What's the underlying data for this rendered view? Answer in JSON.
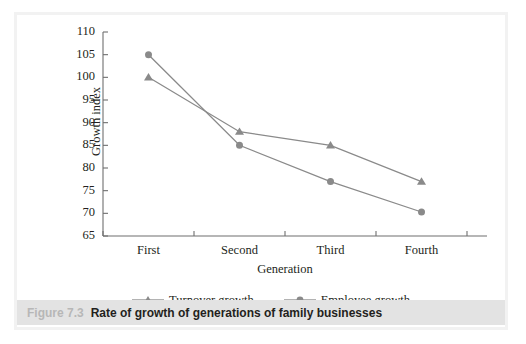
{
  "caption": {
    "figure_number": "Figure 7.3",
    "title": "Rate of growth of generations of family businesses"
  },
  "colors": {
    "series_line": "#8a8a8a",
    "marker": "#8a8a8a",
    "axis": "#6f6f6f",
    "text": "#231f20",
    "caption_band": "#e3e3e3",
    "caption_figno": "#b7b7b7",
    "frame": "#f2f2f2"
  },
  "chart_data": {
    "type": "line",
    "title": "",
    "xlabel": "Generation",
    "ylabel": "Growth index",
    "categories": [
      "First",
      "Second",
      "Third",
      "Fourth"
    ],
    "ylim": [
      65,
      110
    ],
    "yticks": [
      65,
      70,
      75,
      80,
      85,
      90,
      95,
      100,
      105,
      110
    ],
    "ytick_labels": [
      "65",
      "70",
      "75",
      "80",
      "85",
      "90",
      "95",
      "100",
      "105",
      "110"
    ],
    "grid": false,
    "legend_position": "bottom",
    "series": [
      {
        "name": "Turnover growth",
        "marker": "triangle",
        "values": [
          100,
          88,
          85,
          77
        ]
      },
      {
        "name": "Employee growth",
        "marker": "circle",
        "values": [
          105,
          85,
          77,
          70.3
        ]
      }
    ]
  }
}
